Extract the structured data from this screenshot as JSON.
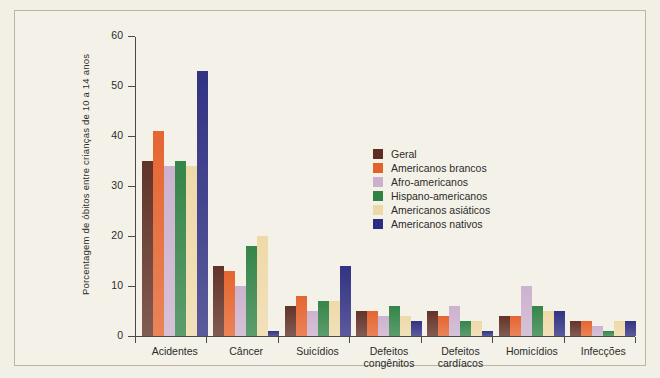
{
  "chart_data": {
    "type": "bar",
    "title": "",
    "xlabel": "",
    "ylabel": "Porcentagem de óbitos entre crianças de 10 a 14 anos",
    "ylim": [
      0,
      60
    ],
    "yticks": [
      0,
      10,
      20,
      30,
      40,
      50,
      60
    ],
    "grid": false,
    "legend_position": "inside-upper-right",
    "categories": [
      "Acidentes",
      "Câncer",
      "Suicídios",
      "Defeitos congênitos",
      "Defeitos cardíacos",
      "Homicídios",
      "Infecções"
    ],
    "category_lines": [
      [
        "Acidentes"
      ],
      [
        "Câncer"
      ],
      [
        "Suicídios"
      ],
      [
        "Defeitos",
        "congênitos"
      ],
      [
        "Defeitos",
        "cardíacos"
      ],
      [
        "Homicídios"
      ],
      [
        "Infecções"
      ]
    ],
    "series": [
      {
        "name": "Geral",
        "color": "#5e2d22",
        "values": [
          35,
          14,
          6,
          5,
          5,
          4,
          3
        ]
      },
      {
        "name": "Americanos brancos",
        "color": "#e4612a",
        "values": [
          41,
          13,
          8,
          5,
          4,
          4,
          3
        ]
      },
      {
        "name": "Afro-americanos",
        "color": "#cbb0cd",
        "values": [
          34,
          10,
          5,
          4,
          6,
          10,
          2
        ]
      },
      {
        "name": "Hispano-americanos",
        "color": "#2f8144",
        "values": [
          35,
          18,
          7,
          6,
          3,
          6,
          1
        ]
      },
      {
        "name": "Americanos asiáticos",
        "color": "#eed8a6",
        "values": [
          34,
          20,
          7,
          4,
          3,
          5,
          3
        ]
      },
      {
        "name": "Americanos nativos",
        "color": "#2c2c80",
        "values": [
          53,
          1,
          14,
          3,
          1,
          5,
          3
        ]
      }
    ]
  }
}
